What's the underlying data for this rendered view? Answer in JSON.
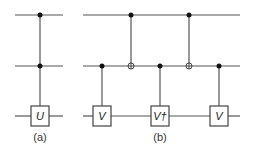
{
  "diagram": {
    "type": "quantum-circuit",
    "colors": {
      "wire": "#555555",
      "dot": "#111111",
      "box_stroke": "#444444",
      "background": "#ffffff"
    },
    "wires_y": [
      15,
      66,
      116
    ],
    "circuit_a": {
      "caption": "(a)",
      "x_range": [
        15,
        63
      ],
      "gates": [
        {
          "type": "controlled-unitary",
          "x": 40,
          "controls": [
            0,
            1
          ],
          "target": 2,
          "label": "U"
        }
      ]
    },
    "circuit_b": {
      "caption": "(b)",
      "x_range": [
        83,
        240
      ],
      "gates": [
        {
          "type": "controlled-unitary",
          "x": 102,
          "controls": [
            1
          ],
          "target": 2,
          "label": "V"
        },
        {
          "type": "cnot",
          "x": 131,
          "controls": [
            0
          ],
          "target": 1
        },
        {
          "type": "controlled-unitary",
          "x": 160,
          "controls": [
            1
          ],
          "target": 2,
          "label": "V†"
        },
        {
          "type": "cnot",
          "x": 189,
          "controls": [
            0
          ],
          "target": 1
        },
        {
          "type": "controlled-unitary",
          "x": 219,
          "controls": [
            1
          ],
          "target": 2,
          "label": "V"
        }
      ]
    }
  }
}
